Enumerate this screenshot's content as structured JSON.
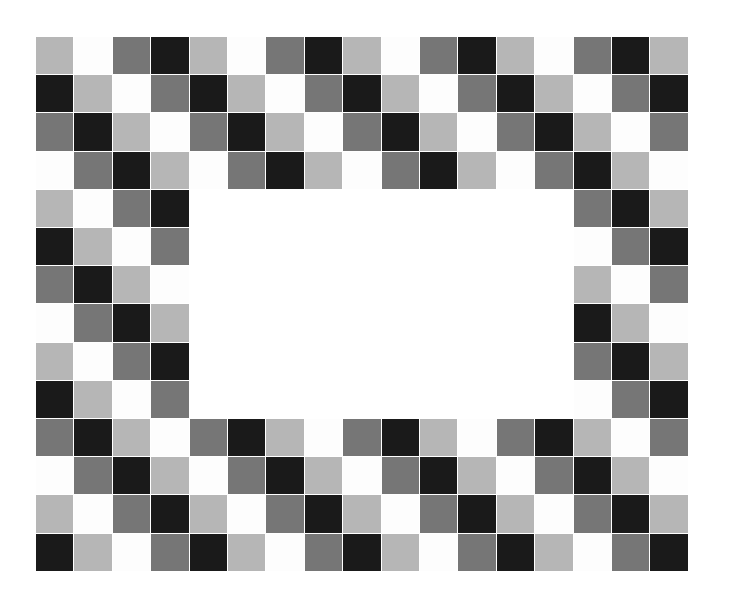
{
  "artwork": {
    "title": "Checkerboard Picture Frame",
    "subject": "decorative mosaic frame of grey-scale squares surrounding a blank white rectangular opening",
    "background_color": "#ffffff",
    "canvas": {
      "width": 743,
      "height": 601
    }
  },
  "frame": {
    "origin_x": 36,
    "origin_y": 37,
    "cell_width": 38.4,
    "cell_height": 38.2,
    "columns": 17,
    "rows": 14,
    "border_thickness_cells": 4,
    "cell_gap": 1.0
  },
  "aperture": {
    "label": "blank white picture opening",
    "x": 189,
    "y": 190,
    "width": 365,
    "height": 229,
    "color": "#ffffff",
    "start_col": 4,
    "end_col": 13,
    "start_row": 4,
    "end_row": 9
  },
  "palette": {
    "names": [
      "light-grey",
      "white",
      "dark-grey",
      "black"
    ],
    "colors": [
      "#b6b6b6",
      "#fdfdfd",
      "#767676",
      "#1a1a1a"
    ],
    "light_grey": "#b6b6b6",
    "white": "#fdfdfd",
    "dark_grey": "#767676",
    "black": "#1a1a1a",
    "sequence_period": 4
  },
  "pattern": {
    "type": "diagonal-cycling-checkerboard",
    "description": "colour index = (column + row) mod 4 stepping through light-grey, white, dark-grey, black",
    "row_shift": 1,
    "rows": [
      [
        0,
        1,
        2,
        3,
        0,
        1,
        2,
        3,
        0,
        1,
        2,
        3,
        0,
        1,
        2,
        3,
        0
      ],
      [
        3,
        0,
        1,
        2,
        3,
        0,
        1,
        2,
        3,
        0,
        1,
        2,
        3,
        0,
        1,
        2,
        3
      ],
      [
        2,
        3,
        0,
        1,
        2,
        3,
        0,
        1,
        2,
        3,
        0,
        1,
        2,
        3,
        0,
        1,
        2
      ],
      [
        1,
        2,
        3,
        0,
        1,
        2,
        3,
        0,
        1,
        2,
        3,
        0,
        1,
        2,
        3,
        0,
        1
      ],
      [
        0,
        1,
        2,
        3,
        0,
        1,
        2,
        3,
        0,
        1,
        2,
        3,
        0,
        1,
        2,
        3,
        0
      ],
      [
        3,
        0,
        1,
        2,
        3,
        0,
        1,
        2,
        3,
        0,
        1,
        2,
        3,
        0,
        1,
        2,
        3
      ],
      [
        2,
        3,
        0,
        1,
        2,
        3,
        0,
        1,
        2,
        3,
        0,
        1,
        2,
        3,
        0,
        1,
        2
      ],
      [
        1,
        2,
        3,
        0,
        1,
        2,
        3,
        0,
        1,
        2,
        3,
        0,
        1,
        2,
        3,
        0,
        1
      ],
      [
        0,
        1,
        2,
        3,
        0,
        1,
        2,
        3,
        0,
        1,
        2,
        3,
        0,
        1,
        2,
        3,
        0
      ],
      [
        3,
        0,
        1,
        2,
        3,
        0,
        1,
        2,
        3,
        0,
        1,
        2,
        3,
        0,
        1,
        2,
        3
      ],
      [
        2,
        3,
        0,
        1,
        2,
        3,
        0,
        1,
        2,
        3,
        0,
        1,
        2,
        3,
        0,
        1,
        2
      ],
      [
        1,
        2,
        3,
        0,
        1,
        2,
        3,
        0,
        1,
        2,
        3,
        0,
        1,
        2,
        3,
        0,
        1
      ],
      [
        0,
        1,
        2,
        3,
        0,
        1,
        2,
        3,
        0,
        1,
        2,
        3,
        0,
        1,
        2,
        3,
        0
      ],
      [
        3,
        0,
        1,
        2,
        3,
        0,
        1,
        2,
        3,
        0,
        1,
        2,
        3,
        0,
        1,
        2,
        3
      ]
    ]
  }
}
